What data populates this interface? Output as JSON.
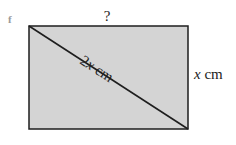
{
  "figure": {
    "part_label": "f",
    "top_side_label": "?",
    "right_side_label": {
      "variable": "x",
      "unit": "cm"
    },
    "diagonal_label": {
      "coefficient": "2",
      "variable": "x",
      "unit": "cm"
    },
    "colors": {
      "fill": "#d4d4d4",
      "stroke": "#1e1e1e"
    }
  }
}
